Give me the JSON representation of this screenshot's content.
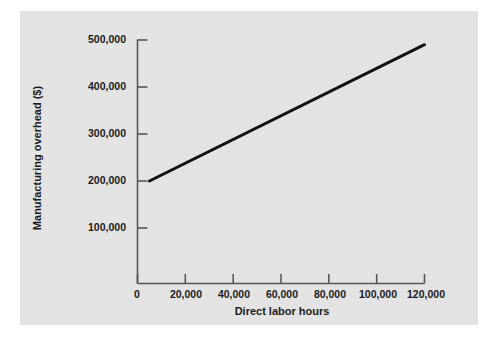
{
  "chart_data": {
    "type": "line",
    "title": "",
    "xlabel": "Direct labor hours",
    "ylabel": "Manufacturing overhead ($)",
    "xlim": [
      0,
      125000
    ],
    "ylim": [
      0,
      520000
    ],
    "grid": false,
    "legend": false,
    "xticks": [
      0,
      20000,
      40000,
      60000,
      80000,
      100000,
      120000
    ],
    "xticklabels": [
      "0",
      "20,000",
      "40,000",
      "60,000",
      "80,000",
      "100,000",
      "120,000"
    ],
    "yticks": [
      100000,
      200000,
      300000,
      400000,
      500000
    ],
    "yticklabels": [
      "100,000",
      "200,000",
      "300,000",
      "400,000",
      "500,000"
    ],
    "series": [
      {
        "name": "Total manufacturing overhead cost",
        "x": [
          5000,
          120000
        ],
        "y": [
          200000,
          490000
        ],
        "color": "#111111",
        "linewidth": 3
      }
    ],
    "annotations": []
  },
  "figure": {
    "background_color": "#ffffff",
    "panel_color": "#e3e3e3",
    "axis_color": "#55565a",
    "text_color": "#1a1a1a"
  }
}
